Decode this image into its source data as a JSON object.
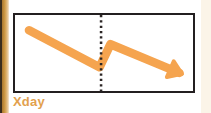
{
  "panel": {
    "border_color": "#231f20",
    "background_color": "#ffffff"
  },
  "axis": {
    "x_label": "Xday"
  },
  "colors": {
    "trend_orange": "#f5a44f",
    "divider_dark": "#2b2524",
    "label_orange": "#e2a14e",
    "page_background": "#ffffff",
    "edge_wood": "#cf9a45"
  },
  "icons": {
    "trend_arrow": "trend-arrow-icon",
    "divider": "dotted-divider-icon"
  },
  "chart_data": {
    "type": "line",
    "title": "",
    "subtitle": "",
    "xlabel": "Xday",
    "ylabel": "",
    "grid": false,
    "legend": null,
    "annotations": [
      {
        "name": "vertical-dotted-divider",
        "x": 0.5,
        "style": "dotted",
        "color": "#2b2524"
      },
      {
        "name": "arrow-head",
        "x": 1.0,
        "y": 0.12,
        "direction": "down-right",
        "color": "#f5a44f"
      }
    ],
    "xlim": [
      0,
      1
    ],
    "ylim": [
      0,
      1
    ],
    "series": [
      {
        "name": "trend",
        "color": "#f5a44f",
        "line_width": 9,
        "arrow_end": true,
        "x": [
          0.04,
          0.49,
          0.56,
          1.0
        ],
        "y": [
          0.88,
          0.22,
          0.63,
          0.12
        ]
      }
    ]
  }
}
